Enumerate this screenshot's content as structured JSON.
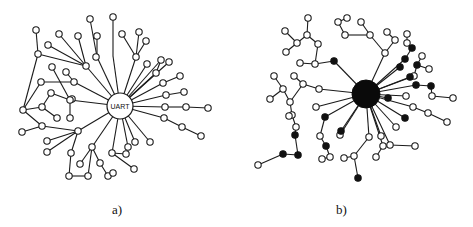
{
  "figure": {
    "panels": [
      {
        "id": "a",
        "caption": "a)",
        "hub": {
          "label": "UART",
          "filled": false,
          "x": 120,
          "y": 106,
          "r": 13
        },
        "nodes": [
          [
            36,
            30
          ],
          [
            59,
            34
          ],
          [
            78,
            36
          ],
          [
            90,
            19
          ],
          [
            97,
            36
          ],
          [
            113,
            17
          ],
          [
            122,
            34
          ],
          [
            139,
            32
          ],
          [
            146,
            41
          ],
          [
            48,
            45
          ],
          [
            38,
            54
          ],
          [
            86,
            66
          ],
          [
            96,
            57
          ],
          [
            136,
            57
          ],
          [
            52,
            67
          ],
          [
            147,
            64
          ],
          [
            161,
            60
          ],
          [
            169,
            62
          ],
          [
            66,
            72
          ],
          [
            156,
            73
          ],
          [
            74,
            82
          ],
          [
            41,
            82
          ],
          [
            163,
            83
          ],
          [
            180,
            76
          ],
          [
            51,
            93
          ],
          [
            72,
            99
          ],
          [
            166,
            95
          ],
          [
            184,
            92
          ],
          [
            23,
            110
          ],
          [
            42,
            107
          ],
          [
            70,
            100
          ],
          [
            165,
            107
          ],
          [
            186,
            107
          ],
          [
            208,
            108
          ],
          [
            57,
            118
          ],
          [
            70,
            118
          ],
          [
            164,
            118
          ],
          [
            182,
            127
          ],
          [
            201,
            136
          ],
          [
            42,
            126
          ],
          [
            78,
            131
          ],
          [
            22,
            132
          ],
          [
            47,
            141
          ],
          [
            92,
            147
          ],
          [
            128,
            147
          ],
          [
            135,
            142
          ],
          [
            150,
            142
          ],
          [
            47,
            152
          ],
          [
            71,
            153
          ],
          [
            112,
            153
          ],
          [
            126,
            154
          ],
          [
            100,
            163
          ],
          [
            134,
            169
          ],
          [
            80,
            164
          ],
          [
            69,
            176
          ],
          [
            88,
            176
          ],
          [
            108,
            176
          ],
          [
            113,
            173
          ]
        ],
        "filled_nodes": [],
        "edges": [
          [
            120,
            106,
            86,
            66
          ],
          [
            86,
            66,
            78,
            36
          ],
          [
            86,
            66,
            48,
            45
          ],
          [
            86,
            66,
            59,
            34
          ],
          [
            86,
            66,
            38,
            54
          ],
          [
            38,
            54,
            36,
            30
          ],
          [
            120,
            106,
            97,
            57
          ],
          [
            97,
            57,
            90,
            19
          ],
          [
            97,
            57,
            97,
            36
          ],
          [
            120,
            106,
            113,
            56
          ],
          [
            113,
            56,
            113,
            17
          ],
          [
            120,
            106,
            136,
            57
          ],
          [
            136,
            57,
            122,
            34
          ],
          [
            136,
            57,
            146,
            41
          ],
          [
            136,
            57,
            139,
            32
          ],
          [
            120,
            106,
            147,
            64
          ],
          [
            120,
            106,
            161,
            60
          ],
          [
            120,
            106,
            169,
            62
          ],
          [
            120,
            106,
            156,
            73
          ],
          [
            156,
            73,
            161,
            60
          ],
          [
            120,
            106,
            163,
            83
          ],
          [
            163,
            83,
            180,
            76
          ],
          [
            120,
            106,
            166,
            95
          ],
          [
            166,
            95,
            184,
            92
          ],
          [
            120,
            106,
            165,
            107
          ],
          [
            165,
            107,
            186,
            107
          ],
          [
            186,
            107,
            208,
            108
          ],
          [
            120,
            106,
            164,
            118
          ],
          [
            164,
            118,
            182,
            127
          ],
          [
            182,
            127,
            201,
            136
          ],
          [
            120,
            106,
            150,
            142
          ],
          [
            120,
            106,
            135,
            142
          ],
          [
            120,
            106,
            128,
            147
          ],
          [
            120,
            106,
            112,
            153
          ],
          [
            112,
            153,
            134,
            169
          ],
          [
            112,
            153,
            126,
            154
          ],
          [
            120,
            106,
            92,
            147
          ],
          [
            92,
            147,
            80,
            164
          ],
          [
            92,
            147,
            100,
            163
          ],
          [
            100,
            163,
            108,
            176
          ],
          [
            92,
            147,
            88,
            176
          ],
          [
            88,
            176,
            69,
            176
          ],
          [
            120,
            106,
            74,
            82
          ],
          [
            74,
            82,
            41,
            82
          ],
          [
            74,
            82,
            66,
            72
          ],
          [
            120,
            106,
            70,
            100
          ],
          [
            70,
            100,
            52,
            67
          ],
          [
            70,
            100,
            70,
            118
          ],
          [
            70,
            100,
            51,
            93
          ],
          [
            38,
            54,
            23,
            110
          ],
          [
            23,
            110,
            42,
            107
          ],
          [
            42,
            107,
            57,
            118
          ],
          [
            42,
            107,
            51,
            93
          ],
          [
            23,
            110,
            41,
            82
          ],
          [
            23,
            110,
            42,
            126
          ],
          [
            42,
            126,
            22,
            132
          ],
          [
            78,
            131,
            42,
            126
          ],
          [
            78,
            131,
            47,
            141
          ],
          [
            78,
            131,
            47,
            152
          ],
          [
            78,
            131,
            71,
            153
          ],
          [
            71,
            153,
            69,
            176
          ],
          [
            120,
            106,
            78,
            131
          ]
        ]
      },
      {
        "id": "b",
        "caption": "b)",
        "hub": {
          "label": "",
          "filled": true,
          "x": 366,
          "y": 94,
          "r": 14
        },
        "nodes": [
          [
            308,
            18
          ],
          [
            338,
            22
          ],
          [
            347,
            18
          ],
          [
            361,
            22
          ],
          [
            285,
            31
          ],
          [
            307,
            35
          ],
          [
            345,
            35
          ],
          [
            370,
            35
          ],
          [
            387,
            32
          ],
          [
            395,
            40
          ],
          [
            407,
            34
          ],
          [
            318,
            44
          ],
          [
            297,
            43
          ],
          [
            286,
            52
          ],
          [
            385,
            53
          ],
          [
            407,
            43
          ],
          [
            422,
            56
          ],
          [
            300,
            63
          ],
          [
            315,
            64
          ],
          [
            274,
            76
          ],
          [
            294,
            76
          ],
          [
            303,
            84
          ],
          [
            283,
            89
          ],
          [
            363,
            91
          ],
          [
            414,
            76
          ],
          [
            429,
            69
          ],
          [
            406,
            96
          ],
          [
            432,
            96
          ],
          [
            453,
            98
          ],
          [
            413,
            107
          ],
          [
            428,
            113
          ],
          [
            447,
            122
          ],
          [
            270,
            99
          ],
          [
            290,
            102
          ],
          [
            319,
            89
          ],
          [
            316,
            107
          ],
          [
            292,
            115
          ],
          [
            296,
            127
          ],
          [
            320,
            136
          ],
          [
            340,
            135
          ],
          [
            330,
            157
          ],
          [
            369,
            137
          ],
          [
            381,
            136
          ],
          [
            383,
            146
          ],
          [
            396,
            127
          ],
          [
            390,
            145
          ],
          [
            258,
            165
          ],
          [
            322,
            159
          ],
          [
            344,
            158
          ],
          [
            354,
            156
          ],
          [
            376,
            157
          ],
          [
            289,
            116
          ],
          [
            415,
            146
          ]
        ],
        "filled_nodes": [
          [
            334,
            61
          ],
          [
            405,
            59
          ],
          [
            412,
            48
          ],
          [
            400,
            67
          ],
          [
            417,
            65
          ],
          [
            410,
            77
          ],
          [
            416,
            85
          ],
          [
            431,
            86
          ],
          [
            405,
            118
          ],
          [
            325,
            117
          ],
          [
            341,
            131
          ],
          [
            295,
            135
          ],
          [
            326,
            146
          ],
          [
            283,
            154
          ],
          [
            298,
            155
          ],
          [
            358,
            178
          ],
          [
            388,
            98
          ]
        ],
        "edges": []
      }
    ]
  }
}
